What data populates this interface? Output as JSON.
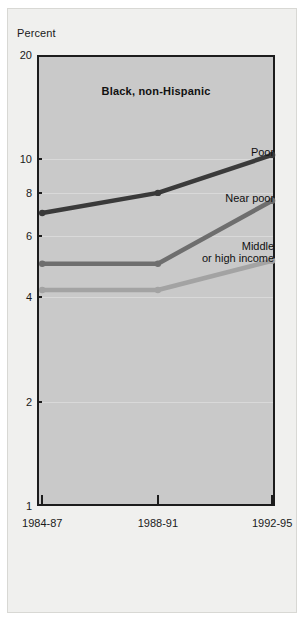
{
  "figure": {
    "y_axis_caption": "Percent",
    "background_color": "#f0f0ee",
    "plot_background_color": "#c9c9c9",
    "axis_color": "#1c1c1c"
  },
  "chart_data": {
    "type": "line",
    "title": "Black, non-Hispanic",
    "xlabel": "",
    "ylabel": "Percent",
    "yscale": "log",
    "ylim": [
      1,
      20
    ],
    "yticks": [
      1,
      2,
      4,
      6,
      8,
      10,
      20
    ],
    "ytick_labels": [
      "1",
      "2",
      "4",
      "6",
      "8",
      "10",
      "20"
    ],
    "grid": true,
    "legend_position": "inline-right",
    "categories": [
      "1984-87",
      "1988-91",
      "1992-95"
    ],
    "series": [
      {
        "name": "Poor",
        "label": "Poor",
        "color": "#3a3a3a",
        "values": [
          7.0,
          8.0,
          10.3
        ]
      },
      {
        "name": "Near poor",
        "label": "Near poor",
        "color": "#6e6e6e",
        "values": [
          5.0,
          5.0,
          7.6
        ]
      },
      {
        "name": "Middle or high income",
        "label": "Middle\nor high income",
        "color": "#a3a3a3",
        "values": [
          4.2,
          4.2,
          5.1
        ]
      }
    ]
  }
}
